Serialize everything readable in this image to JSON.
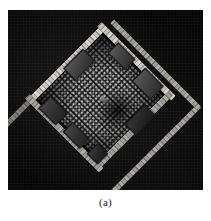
{
  "figure": {
    "caption": "(a)",
    "scene_kind": "top-down-rendered-room",
    "background_color": "#070707",
    "wall_color": "#c6c2bb",
    "block_color": "#434343",
    "crowd_color": "#b9b9b9",
    "frame": {
      "x": 8,
      "y": 10,
      "width": 195,
      "height": 180
    }
  },
  "scene": {
    "outer_wall": {
      "name": "outer perimeter wall",
      "color": "#c6c2bb",
      "segments": [
        {
          "id": "outer-top-left",
          "label": "upper-left outer wall"
        },
        {
          "id": "outer-bottom-left",
          "label": "lower-left outer wall"
        },
        {
          "id": "outer-bottom-right",
          "label": "lower-right outer wall"
        },
        {
          "id": "outer-stub",
          "label": "corridor stub"
        }
      ]
    },
    "inner_room": {
      "name": "inner room",
      "floor_color": "#1b1b1b",
      "walls": [
        {
          "id": "inner-top",
          "label": "inner top wall"
        },
        {
          "id": "inner-right",
          "label": "inner right wall"
        },
        {
          "id": "inner-bottom",
          "label": "inner bottom wall"
        },
        {
          "id": "inner-left",
          "label": "inner left wall"
        }
      ],
      "blocks": [
        {
          "id": "block-top",
          "label": "furniture block top"
        },
        {
          "id": "block-top-left",
          "label": "furniture block upper left"
        },
        {
          "id": "block-left",
          "label": "furniture block left"
        },
        {
          "id": "block-right",
          "label": "furniture block right"
        },
        {
          "id": "block-bottom-right",
          "label": "furniture block lower right"
        },
        {
          "id": "block-bottom",
          "label": "furniture block bottom"
        },
        {
          "id": "block-door",
          "label": "doorway block"
        }
      ],
      "crowd": {
        "label": "dense crowd of agents",
        "density": "high",
        "dot_color": "#b9b9b9"
      },
      "avatar": {
        "label": "central agent marker"
      }
    }
  }
}
